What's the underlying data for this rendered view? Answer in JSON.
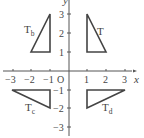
{
  "diagram": {
    "title": "",
    "origin_label": "O",
    "x_axis_label": "x",
    "y_axis_label": "y",
    "x_ticks": [
      "−3",
      "−2",
      "−1",
      "1",
      "2",
      "3"
    ],
    "y_ticks": [
      "3",
      "2",
      "1",
      "−1",
      "−2",
      "−3"
    ],
    "triangles": [
      {
        "name": "T",
        "label": "T",
        "subscript": "",
        "vertices": [
          [
            1,
            1
          ],
          [
            2,
            1
          ],
          [
            1,
            3
          ]
        ]
      },
      {
        "name": "Tb",
        "label": "T",
        "subscript": "b",
        "vertices": [
          [
            -1,
            1
          ],
          [
            -2,
            1
          ],
          [
            -1,
            3
          ]
        ]
      },
      {
        "name": "Tc",
        "label": "T",
        "subscript": "c",
        "vertices": [
          [
            -1,
            -1
          ],
          [
            -3,
            -1
          ],
          [
            -1,
            -2
          ]
        ]
      },
      {
        "name": "Td",
        "label": "T",
        "subscript": "d",
        "vertices": [
          [
            1,
            -1
          ],
          [
            3,
            -1
          ],
          [
            1,
            -2
          ]
        ]
      }
    ]
  }
}
